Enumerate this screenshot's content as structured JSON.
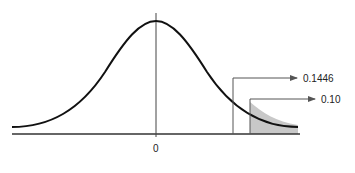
{
  "diagram": {
    "type": "normal-distribution-curve",
    "axis_label_center": "0",
    "annotations": [
      {
        "label": "0.1446",
        "marker_x": 233,
        "arrow_y": 78
      },
      {
        "label": "0.10",
        "marker_x": 250,
        "arrow_y": 99
      }
    ],
    "shaded_region": "right tail beyond 0.10 marker",
    "colors": {
      "curve": "#111111",
      "axis": "#333333",
      "marker": "#555555",
      "shade": "#c8c8c8"
    }
  }
}
